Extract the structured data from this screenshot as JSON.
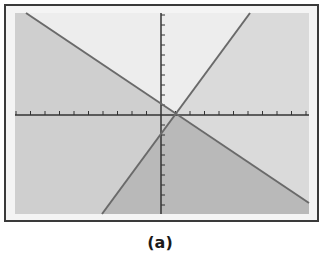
{
  "caption": "(a)",
  "figure": {
    "frame": {
      "x": 5,
      "y": 5,
      "width": 313,
      "height": 216
    },
    "plot_area": {
      "x": 15,
      "y": 13,
      "width": 294,
      "height": 201
    },
    "axes": {
      "origin": [
        161,
        115
      ],
      "x_tick_spacing": 14.5,
      "y_tick_spacing": 10
    },
    "lines": [
      {
        "name": "descending-line",
        "from": [
          26,
          13
        ],
        "to": [
          309,
          203
        ]
      },
      {
        "name": "ascending-line",
        "from": [
          102,
          214
        ],
        "to": [
          250,
          13
        ]
      }
    ],
    "colors": {
      "frame": "#3a3a3a",
      "background": "#f2f2f2",
      "region_left": "#cfcfcf",
      "region_top": "#ededed",
      "region_right": "#dadada",
      "region_bottom": "#b9b9b9",
      "line": "#6a6a6a",
      "axis": "#333333"
    }
  }
}
